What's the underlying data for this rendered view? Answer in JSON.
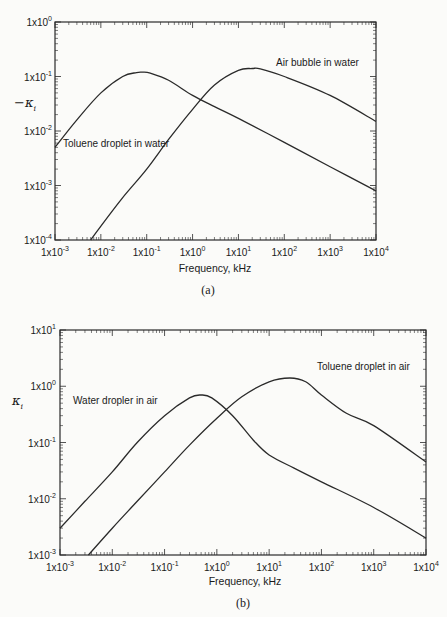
{
  "chart_data": [
    {
      "type": "line",
      "panel": "(a)",
      "title": "",
      "xlabel": "Frequency, kHz",
      "ylabel": "−κ_i",
      "xscale": "log",
      "yscale": "log",
      "xlim": [
        0.001,
        10000
      ],
      "ylim": [
        0.0001,
        1
      ],
      "x_ticks": [
        "1x10-3",
        "1x10-2",
        "1x10-1",
        "1x100",
        "1x101",
        "1x102",
        "1x103",
        "1x104"
      ],
      "y_ticks": [
        "1x100",
        "1x10-1",
        "1x10-2",
        "1x10-3",
        "1x10-4"
      ],
      "grid": false,
      "legend": "none (inline curve labels)",
      "series": [
        {
          "name": "Toluene droplet in water",
          "x": [
            0.001,
            0.003,
            0.01,
            0.03,
            0.06,
            0.08,
            0.12,
            0.3,
            1,
            3,
            10,
            100,
            1000,
            10000
          ],
          "values": [
            0.005,
            0.016,
            0.05,
            0.1,
            0.118,
            0.12,
            0.115,
            0.085,
            0.045,
            0.028,
            0.017,
            0.0062,
            0.0022,
            0.0008
          ]
        },
        {
          "name": "Air bubble in water",
          "x": [
            0.006,
            0.01,
            0.03,
            0.1,
            0.3,
            1,
            3,
            10,
            20,
            30,
            100,
            1000,
            10000
          ],
          "values": [
            0.0001,
            0.00018,
            0.0006,
            0.002,
            0.007,
            0.025,
            0.07,
            0.13,
            0.14,
            0.138,
            0.1,
            0.045,
            0.015
          ]
        }
      ],
      "annotations": [
        "Toluene droplet in water",
        "Air bubble in water"
      ],
      "caption": "(a)"
    },
    {
      "type": "line",
      "panel": "(b)",
      "title": "",
      "xlabel": "Frequency, kHz",
      "ylabel": "κ_i",
      "xscale": "log",
      "yscale": "log",
      "xlim": [
        0.001,
        10000
      ],
      "ylim": [
        0.001,
        10
      ],
      "x_ticks": [
        "1x10-3",
        "1x10-2",
        "1x10-1",
        "1x100",
        "1x101",
        "1x102",
        "1x103",
        "1x104"
      ],
      "y_ticks": [
        "1x101",
        "1x100",
        "1x10-1",
        "1x10-2",
        "1x10-3"
      ],
      "grid": false,
      "legend": "none (inline curve labels)",
      "series": [
        {
          "name": "Water dropler in air",
          "x": [
            0.001,
            0.003,
            0.01,
            0.03,
            0.1,
            0.3,
            0.5,
            0.8,
            2,
            5,
            10,
            30,
            100,
            1000,
            10000
          ],
          "values": [
            0.003,
            0.009,
            0.03,
            0.1,
            0.3,
            0.62,
            0.7,
            0.62,
            0.3,
            0.11,
            0.06,
            0.035,
            0.02,
            0.007,
            0.002
          ]
        },
        {
          "name": "Toluene droplet in air",
          "x": [
            0.0035,
            0.01,
            0.03,
            0.1,
            0.3,
            1,
            3,
            10,
            25,
            50,
            100,
            300,
            1000,
            10000
          ],
          "values": [
            0.001,
            0.003,
            0.009,
            0.03,
            0.09,
            0.27,
            0.65,
            1.2,
            1.4,
            1.2,
            0.7,
            0.33,
            0.2,
            0.045
          ]
        }
      ],
      "annotations": [
        "Water dropler in air",
        "Toluene droplet in air"
      ],
      "caption": "(b)"
    }
  ],
  "panels": {
    "a": {
      "ylabel_main": "−κ",
      "ylabel_sub": "i",
      "xlabel": "Frequency, kHz",
      "caption": "(a)",
      "curve_labels": [
        "Toluene droplet in water",
        "Air bubble in water"
      ],
      "y_tick_labels": [
        {
          "base": "1x10",
          "exp": "0"
        },
        {
          "base": "1x10",
          "exp": "-1"
        },
        {
          "base": "1x10",
          "exp": "-2"
        },
        {
          "base": "1x10",
          "exp": "-3"
        },
        {
          "base": "1x10",
          "exp": "-4"
        }
      ]
    },
    "b": {
      "ylabel_main": "κ",
      "ylabel_sub": "i",
      "xlabel": "Frequency, kHz",
      "caption": "(b)",
      "curve_labels": [
        "Water dropler in air",
        "Toluene droplet in air"
      ],
      "y_tick_labels": [
        {
          "base": "1x10",
          "exp": "1"
        },
        {
          "base": "1x10",
          "exp": "0"
        },
        {
          "base": "1x10",
          "exp": "-1"
        },
        {
          "base": "1x10",
          "exp": "-2"
        },
        {
          "base": "1x10",
          "exp": "-3"
        }
      ]
    },
    "x_tick_labels": [
      {
        "base": "1x10",
        "exp": "-3"
      },
      {
        "base": "1x10",
        "exp": "-2"
      },
      {
        "base": "1x10",
        "exp": "-1"
      },
      {
        "base": "1x10",
        "exp": "0"
      },
      {
        "base": "1x10",
        "exp": "1"
      },
      {
        "base": "1x10",
        "exp": "2"
      },
      {
        "base": "1x10",
        "exp": "3"
      },
      {
        "base": "1x10",
        "exp": "4"
      }
    ]
  },
  "colors": {
    "line": "#2a2a2a",
    "background": "#fbfbf9",
    "text": "#1a1a1a"
  }
}
